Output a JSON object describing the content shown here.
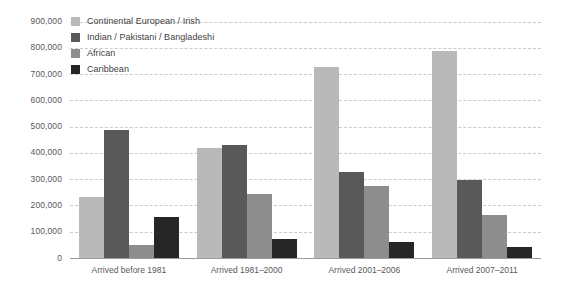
{
  "chart_data": {
    "type": "bar",
    "title": "",
    "subtitle": "",
    "xlabel": "",
    "ylabel": "",
    "grid": true,
    "legend_position": "top-left",
    "ylim": [
      0,
      900000
    ],
    "yticks": [
      0,
      100000,
      200000,
      300000,
      400000,
      500000,
      600000,
      700000,
      800000,
      900000
    ],
    "ytick_labels": [
      "0",
      "100,000",
      "200,000",
      "300,000",
      "400,000",
      "500,000",
      "600,000",
      "700,000",
      "800,000",
      "900,000"
    ],
    "categories": [
      "Arrived before 1981",
      "Arrived 1981–2000",
      "Arrived 2001–2006",
      "Arrived 2007–2011"
    ],
    "series": [
      {
        "name": "Continental European / Irish",
        "color": "#b9b9b9",
        "values": [
          232000,
          418000,
          727000,
          788000
        ]
      },
      {
        "name": "Indian / Pakistani / Bangladeshi",
        "color": "#595959",
        "values": [
          487000,
          430000,
          327000,
          297000
        ]
      },
      {
        "name": "African",
        "color": "#8d8d8d",
        "values": [
          50000,
          243000,
          274000,
          163000
        ]
      },
      {
        "name": "Caribbean",
        "color": "#262626",
        "values": [
          155000,
          72000,
          62000,
          41000
        ]
      }
    ]
  },
  "legend": {
    "items": [
      {
        "label": "Continental European / Irish",
        "color": "#b9b9b9"
      },
      {
        "label": "Indian / Pakistani / Bangladeshi",
        "color": "#595959"
      },
      {
        "label": "African",
        "color": "#8d8d8d"
      },
      {
        "label": "Caribbean",
        "color": "#262626"
      }
    ]
  },
  "axis": {
    "baseline_color": "#9a9c9e",
    "gridline_color": "#c9cbcd",
    "tick_label_color": "#58595b"
  }
}
